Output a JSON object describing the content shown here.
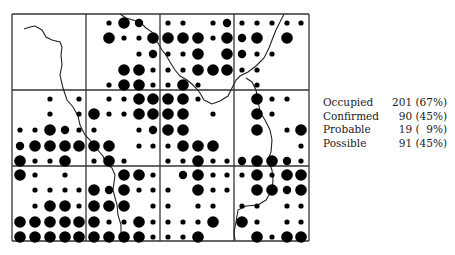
{
  "chart_data": {
    "type": "grid-dot-map",
    "title": "",
    "grid": {
      "rows": 3,
      "cols": 4,
      "subgrid": 5
    },
    "dot_size_legend": {
      "s": "small",
      "m": "medium",
      "L": "large"
    },
    "cells": [
      [
        [
          [
            "",
            "",
            "",
            "",
            ""
          ],
          [
            "",
            "",
            "",
            "",
            ""
          ],
          [
            "",
            "",
            "",
            "",
            ""
          ],
          [
            "",
            "",
            "",
            "",
            ""
          ],
          [
            "",
            "",
            "",
            "",
            ""
          ]
        ],
        [
          [
            "",
            "s",
            "L",
            "m",
            ""
          ],
          [
            "",
            "L",
            "s",
            "s",
            "L"
          ],
          [
            "",
            "",
            "",
            "s",
            "m"
          ],
          [
            "",
            "",
            "L",
            "L",
            "s"
          ],
          [
            "",
            "s",
            "L",
            "L",
            "s"
          ]
        ],
        [
          [
            "s",
            "s",
            "",
            "s",
            "m"
          ],
          [
            "L",
            "L",
            "L",
            "s",
            "L"
          ],
          [
            "s",
            "s",
            "L",
            "",
            "L"
          ],
          [
            "s",
            "s",
            "L",
            "L",
            "L"
          ],
          [
            "s",
            "L",
            "s",
            "",
            ""
          ]
        ],
        [
          [
            "s",
            "s",
            "s",
            "s",
            "s"
          ],
          [
            "m",
            "L",
            "",
            "L",
            ""
          ],
          [
            "m",
            "s",
            "s",
            "",
            ""
          ],
          [
            "s",
            "s",
            "",
            "",
            ""
          ],
          [
            "",
            "s",
            "",
            "",
            ""
          ]
        ]
      ],
      [
        [
          [
            "",
            "",
            "s",
            "",
            "s"
          ],
          [
            "",
            "",
            "s",
            "",
            "s"
          ],
          [
            "s",
            "s",
            "L",
            "m",
            "s"
          ],
          [
            "m",
            "L",
            "L",
            "L",
            "L"
          ],
          [
            "L",
            "s",
            "s",
            "L",
            ""
          ]
        ],
        [
          [
            "",
            "s",
            "s",
            "L",
            "L"
          ],
          [
            "L",
            "s",
            "s",
            "L",
            "L"
          ],
          [
            "s",
            "",
            "",
            "s",
            "m"
          ],
          [
            "L",
            "L",
            "",
            "s",
            "s"
          ],
          [
            "s",
            "L",
            "s",
            "",
            ""
          ]
        ],
        [
          [
            "L",
            "L",
            "s",
            "",
            ""
          ],
          [
            "L",
            "L",
            "",
            "s",
            ""
          ],
          [
            "L",
            "L",
            "",
            "",
            ""
          ],
          [
            "s",
            "L",
            "L",
            "L",
            ""
          ],
          [
            "s",
            "s",
            "L",
            "s",
            "s"
          ]
        ],
        [
          [
            "",
            "L",
            "s",
            "s",
            ""
          ],
          [
            "",
            "L",
            "s",
            "",
            ""
          ],
          [
            "",
            "L",
            "",
            "s",
            "L"
          ],
          [
            "",
            "",
            "",
            "",
            "s"
          ],
          [
            "m",
            "L",
            "L",
            "m",
            "s"
          ]
        ]
      ],
      [
        [
          [
            "L",
            "s",
            "",
            "s",
            ""
          ],
          [
            "",
            "s",
            "s",
            "s",
            "s"
          ],
          [
            "",
            "s",
            "L",
            "L",
            "s"
          ],
          [
            "L",
            "L",
            "L",
            "L",
            "L"
          ],
          [
            "L",
            "L",
            "L",
            "L",
            "L"
          ]
        ],
        [
          [
            "",
            "",
            "L",
            "L",
            "s"
          ],
          [
            "L",
            "m",
            "L",
            "s",
            "s"
          ],
          [
            "L",
            "L",
            "L",
            "",
            "s"
          ],
          [
            "L",
            "s",
            "s",
            "L",
            "s"
          ],
          [
            "L",
            "L",
            "L",
            "L",
            "s"
          ]
        ],
        [
          [
            "",
            "m",
            "L",
            "s",
            "s"
          ],
          [
            "s",
            "",
            "L",
            "s",
            "s"
          ],
          [
            "s",
            "",
            "s",
            "s",
            ""
          ],
          [
            "s",
            "s",
            "s",
            "L",
            ""
          ],
          [
            "s",
            "s",
            "L",
            "",
            ""
          ]
        ],
        [
          [
            "s",
            "L",
            "s",
            "L",
            "L"
          ],
          [
            "",
            "L",
            "L",
            "m",
            "L"
          ],
          [
            "s",
            "s",
            "",
            "s",
            "s"
          ],
          [
            "L",
            "s",
            "",
            "s",
            "s"
          ],
          [
            "",
            "L",
            "s",
            "L",
            "L"
          ]
        ]
      ]
    ],
    "river_paths": [
      "M24,29 L30,27 L35,26 L42,30 L46,37 L52,40 L60,42 L62,47 L61,55 L62,65 L60,75 L63,88 L67,100 L73,107 L78,116 L80,125 L85,135 L90,140 L96,148 L103,156 L106,164 L112,168 L115,175 L113,190 L117,205 L118,215 L121,225 L121,240",
      "M120,14 L126,18 L133,20 L140,22 L146,28 L152,32 L155,40 L158,43 L162,50 L166,55 L170,62 L175,70 L180,76 L187,80 L192,84 L196,88 L200,93 L204,100 L212,104 L220,101 L228,96 L232,88 L236,80 L240,76 L248,72 L256,66 L264,58 L269,48 L272,40 L276,30 L280,22 L284,14",
      "M246,78 L252,82 L256,90 L258,100 L260,112 L265,120 L270,130 L272,140 L271,152 L268,160 L272,170 L273,180 L272,190 L266,200 L258,205 L246,206 L238,210 L236,222 L234,232 L235,240"
    ]
  },
  "legend": {
    "rows": [
      {
        "label": "Occupied",
        "value": "201 (67%)"
      },
      {
        "label": "Confirmed",
        "value": "90 (45%)"
      },
      {
        "label": "Probable",
        "value": "19 (  9%)"
      },
      {
        "label": "Possible",
        "value": "91 (45%)"
      }
    ]
  }
}
